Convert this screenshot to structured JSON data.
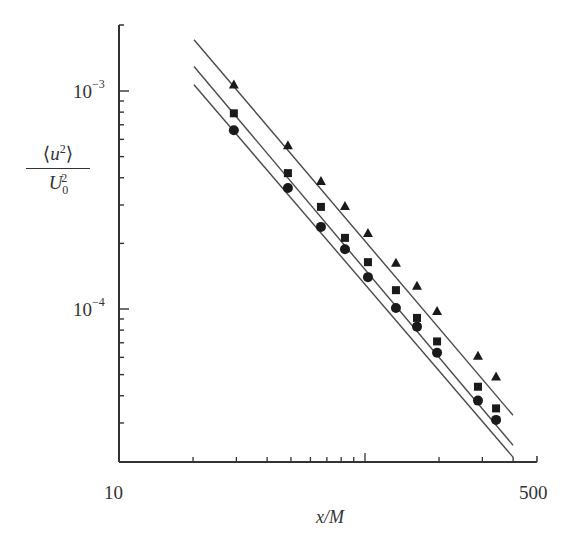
{
  "chart_data": {
    "type": "scatter",
    "title": "",
    "xlabel": "x/M",
    "ylabel": "<u^2>/U0^2",
    "xscale": "log",
    "yscale": "log",
    "xlim": [
      10,
      500
    ],
    "ylim": [
      2e-05,
      0.002
    ],
    "x_tick_labels": [
      "10",
      "500"
    ],
    "y_tick_labels": [
      "10^-3",
      "10^-4"
    ],
    "grid": false,
    "legend": null,
    "series": [
      {
        "name": "triangles",
        "marker": "triangle",
        "x": [
          29.3,
          48.6,
          66.2,
          82.9,
          102.8,
          133.6,
          162.7,
          196.3,
          287.9,
          341
        ],
        "y": [
          0.00107,
          0.000564,
          0.000386,
          0.000297,
          0.000223,
          0.000163,
          0.000128,
          9.8e-05,
          6.1e-05,
          4.9e-05
        ],
        "fit_line": {
          "x": [
            20,
            400
          ],
          "y": [
            0.00174,
            3.25e-05
          ]
        }
      },
      {
        "name": "squares",
        "marker": "square",
        "x": [
          29.3,
          48.6,
          66.2,
          82.9,
          102.8,
          133.6,
          162.7,
          196.3,
          287.9,
          341
        ],
        "y": [
          0.00079,
          0.00042,
          0.000294,
          0.000212,
          0.000164,
          0.000122,
          9.1e-05,
          7.1e-05,
          4.4e-05,
          3.5e-05
        ],
        "fit_line": {
          "x": [
            20,
            400
          ],
          "y": [
            0.00131,
            2.37e-05
          ]
        }
      },
      {
        "name": "circles",
        "marker": "circle",
        "x": [
          29.3,
          48.6,
          66.2,
          82.9,
          102.8,
          133.6,
          162.7,
          196.3,
          287.9,
          341
        ],
        "y": [
          0.00066,
          0.000359,
          0.000238,
          0.000188,
          0.00014,
          0.000101,
          8.3e-05,
          6.3e-05,
          3.8e-05,
          3.1e-05
        ],
        "fit_line": {
          "x": [
            20,
            400
          ],
          "y": [
            0.00108,
            2.09e-05
          ]
        }
      }
    ]
  },
  "labels": {
    "y_tick_major_1_base": "10",
    "y_tick_major_1_exp": "−3",
    "y_tick_major_2_base": "10",
    "y_tick_major_2_exp": "−4",
    "x_tick_left": "10",
    "x_tick_right": "500",
    "x_axis_label": "x/M",
    "y_axis_num_u": "u",
    "y_axis_num_exp": "2",
    "y_axis_den_u": "U",
    "y_axis_den_exp": "2",
    "y_axis_den_sub": "0"
  },
  "style": {
    "axis_color": "#333333",
    "line_color": "#4a4a4a",
    "marker_color": "#1a1a1a"
  }
}
